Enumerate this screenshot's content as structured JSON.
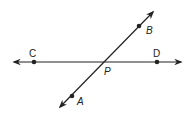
{
  "diagram": {
    "type": "intersecting-lines",
    "lines": [
      {
        "name": "line-CD",
        "from": [
          14,
          62
        ],
        "to": [
          181,
          62
        ],
        "points": [
          "C",
          "P",
          "D"
        ]
      },
      {
        "name": "line-AB",
        "from": [
          60,
          107
        ],
        "to": [
          153,
          12
        ],
        "points": [
          "A",
          "P",
          "B"
        ]
      }
    ],
    "points": {
      "C": {
        "label": "C",
        "x": 34,
        "y": 62
      },
      "D": {
        "label": "D",
        "x": 157,
        "y": 62
      },
      "P": {
        "label": "P",
        "x": 105,
        "y": 62
      },
      "B": {
        "label": "B",
        "x": 139,
        "y": 26
      },
      "A": {
        "label": "A",
        "x": 72,
        "y": 96
      }
    },
    "color": "#222222"
  }
}
